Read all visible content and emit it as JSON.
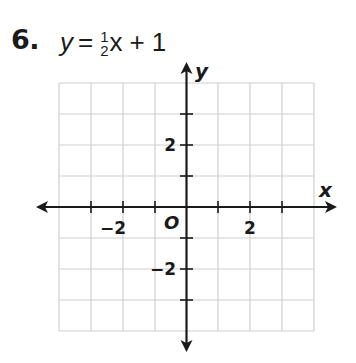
{
  "problem": {
    "number": "6.",
    "equation": {
      "lhs": "y",
      "equals": "=",
      "coefficient_numerator": "1",
      "coefficient_denominator": "2",
      "variable": "x",
      "operator": "+",
      "constant": "1"
    }
  },
  "graph": {
    "x_axis_label": "x",
    "y_axis_label": "y",
    "origin_label": "O",
    "x_tick_labels": [
      {
        "value": -2,
        "text": "−2"
      },
      {
        "value": 2,
        "text": "2"
      }
    ],
    "y_tick_labels": [
      {
        "value": 2,
        "text": "2"
      },
      {
        "value": -2,
        "text": "−2"
      }
    ],
    "grid": {
      "x_min": -4,
      "x_max": 4,
      "y_min": -4,
      "y_max": 4,
      "step": 1
    },
    "colors": {
      "grid": "#cfcfcf",
      "axis": "#1a1a1a"
    }
  }
}
